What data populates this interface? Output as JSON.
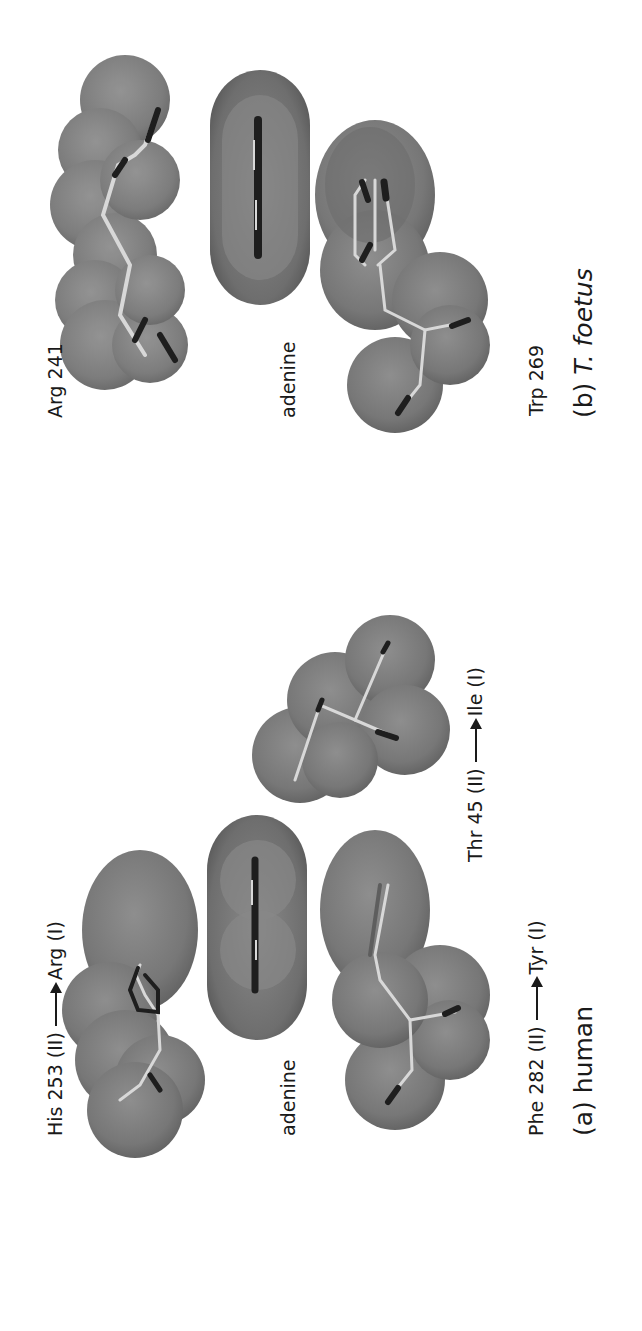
{
  "figure": {
    "orientation": "rotated 90deg counter-clockwise",
    "panels": [
      {
        "id": "b",
        "caption_prefix": "(b)",
        "caption_organism": "T. foetus",
        "residues": {
          "top": "Arg 241",
          "middle": "adenine",
          "bottom": "Trp 269"
        }
      },
      {
        "id": "a",
        "caption_prefix": "(a)",
        "caption_organism": "human",
        "residues": {
          "top": {
            "from": "His 253 (II)",
            "to": "Arg (I)"
          },
          "middle": "adenine",
          "bottom": {
            "from": "Phe 282 (II)",
            "to": "Tyr (I)"
          },
          "extra": {
            "from": "Thr 45 (II)",
            "to": "Ile (I)"
          }
        }
      }
    ],
    "colors": {
      "background": "#ffffff",
      "surface": "#7a7a7a",
      "surface_dark": "#5e5e5e",
      "surface_light": "#959595",
      "stick_dark": "#1e1e1e",
      "stick_light": "#d8d8d8",
      "text": "#1a1a1a"
    }
  }
}
